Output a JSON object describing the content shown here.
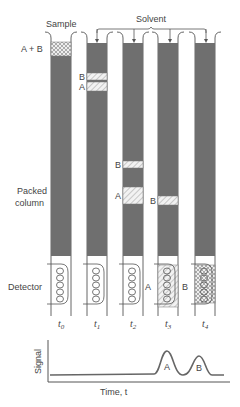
{
  "labels": {
    "sample": "Sample",
    "solvent": "Solvent",
    "a_plus_b": "A + B",
    "packed_column_line1": "Packed",
    "packed_column_line2": "column",
    "detector": "Detector",
    "signal_axis": "Signal",
    "time_axis": "Time, t"
  },
  "columns": [
    {
      "time_label": "t0",
      "sub": "0",
      "bands": [
        {
          "name": "A + B",
          "label": "",
          "y_top": 42,
          "y_bot": 56,
          "pattern": "cross"
        }
      ],
      "detector_band": null
    },
    {
      "time_label": "t1",
      "sub": "1",
      "bands": [
        {
          "name": "B",
          "label": "B",
          "y_top": 73,
          "y_bot": 80,
          "pattern": "hatch"
        },
        {
          "name": "A",
          "label": "A",
          "y_top": 82,
          "y_bot": 91,
          "pattern": "hatch"
        }
      ],
      "detector_band": null
    },
    {
      "time_label": "t2",
      "sub": "2",
      "bands": [
        {
          "name": "B",
          "label": "B",
          "y_top": 161,
          "y_bot": 168,
          "pattern": "hatch"
        },
        {
          "name": "A",
          "label": "A",
          "y_top": 187,
          "y_bot": 204,
          "pattern": "hatch"
        }
      ],
      "detector_band": null
    },
    {
      "time_label": "t3",
      "sub": "3",
      "bands": [
        {
          "name": "B",
          "label": "B",
          "y_top": 196,
          "y_bot": 205,
          "pattern": "hatch"
        }
      ],
      "detector_band": {
        "name": "A",
        "label": "A",
        "pattern": "hatch"
      }
    },
    {
      "time_label": "t4",
      "sub": "4",
      "bands": [],
      "detector_band": {
        "name": "B",
        "label": "B",
        "pattern": "cross"
      }
    }
  ],
  "chart": {
    "peaks": [
      {
        "label": "A",
        "time": "t3"
      },
      {
        "label": "B",
        "time": "t4"
      }
    ]
  },
  "colors": {
    "packing": "#6f6f6f",
    "outline": "#555555",
    "text": "#444444"
  }
}
